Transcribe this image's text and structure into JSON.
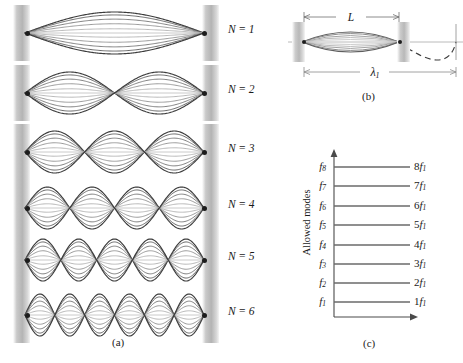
{
  "figure": {
    "type": "physics-diagram"
  },
  "panel_a": {
    "caption": "(a)",
    "rows": [
      {
        "mode": 1,
        "label": "N = 1",
        "n_symbol": "N",
        "equals": "=",
        "value": "1",
        "antinodes": 1
      },
      {
        "mode": 2,
        "label": "N = 2",
        "n_symbol": "N",
        "equals": "=",
        "value": "2",
        "antinodes": 2
      },
      {
        "mode": 3,
        "label": "N = 3",
        "n_symbol": "N",
        "equals": "=",
        "value": "3",
        "antinodes": 3
      },
      {
        "mode": 4,
        "label": "N = 4",
        "n_symbol": "N",
        "equals": "=",
        "value": "4",
        "antinodes": 4
      },
      {
        "mode": 5,
        "label": "N = 5",
        "n_symbol": "N",
        "equals": "=",
        "value": "5",
        "antinodes": 5
      },
      {
        "mode": 6,
        "label": "N = 6",
        "n_symbol": "N",
        "equals": "=",
        "value": "6",
        "antinodes": 6
      }
    ]
  },
  "panel_b": {
    "caption": "(b)",
    "length_label": "L",
    "wavelength_label": "λ",
    "wavelength_sub": "1",
    "note": "fundamental mode with half wavelength between the supports; dashed continuation completes one full wavelength"
  },
  "panel_c": {
    "caption": "(c)",
    "axis_label": "Allowed modes",
    "chart_data": {
      "type": "bar",
      "title": "Allowed modes",
      "xlabel": "",
      "ylabel": "Allowed modes",
      "orientation": "horizontal-levels",
      "grid": false,
      "legend": false,
      "ylim": [
        0,
        9
      ],
      "categories": [
        "f1",
        "f2",
        "f3",
        "f4",
        "f5",
        "f6",
        "f7",
        "f8"
      ],
      "values": [
        1,
        2,
        3,
        4,
        5,
        6,
        7,
        8
      ],
      "left_tick_labels": [
        {
          "base": "f",
          "sub": "1"
        },
        {
          "base": "f",
          "sub": "2"
        },
        {
          "base": "f",
          "sub": "3"
        },
        {
          "base": "f",
          "sub": "4"
        },
        {
          "base": "f",
          "sub": "5"
        },
        {
          "base": "f",
          "sub": "6"
        },
        {
          "base": "f",
          "sub": "7"
        },
        {
          "base": "f",
          "sub": "8"
        }
      ],
      "right_tick_labels": [
        {
          "coef": "1",
          "base": "f",
          "sub": "1"
        },
        {
          "coef": "2",
          "base": "f",
          "sub": "1"
        },
        {
          "coef": "3",
          "base": "f",
          "sub": "1"
        },
        {
          "coef": "4",
          "base": "f",
          "sub": "1"
        },
        {
          "coef": "5",
          "base": "f",
          "sub": "1"
        },
        {
          "coef": "6",
          "base": "f",
          "sub": "1"
        },
        {
          "coef": "7",
          "base": "f",
          "sub": "1"
        },
        {
          "coef": "8",
          "base": "f",
          "sub": "1"
        }
      ]
    }
  },
  "colors": {
    "wave_dark": "#5a5a5a",
    "wave_light": "#c4c4c4",
    "wall": "#bdbdbd",
    "axis": "#4a4a4a",
    "text": "#1a1a1a"
  }
}
